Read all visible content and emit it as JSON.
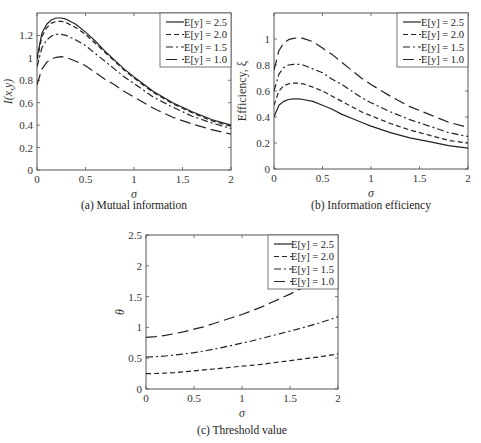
{
  "chart_data": [
    {
      "id": "a",
      "type": "line",
      "caption": "(a) Mutual information",
      "xlabel": "σ",
      "ylabel": "I(x,y)",
      "xlim": [
        0,
        2
      ],
      "ylim": [
        0,
        1.4
      ],
      "xticks": [
        "0",
        "0.5",
        "1",
        "1.5",
        "2"
      ],
      "yticks": [
        "0",
        "0.2",
        "0.4",
        "0.6",
        "0.8",
        "1",
        "1.2"
      ],
      "ytick_values": [
        0,
        0.2,
        0.4,
        0.6,
        0.8,
        1.0,
        1.2
      ],
      "xtick_values": [
        0,
        0.5,
        1,
        1.5,
        2
      ],
      "grid": false,
      "legend": "top-right",
      "x": [
        0,
        0.05,
        0.1,
        0.15,
        0.2,
        0.25,
        0.3,
        0.4,
        0.5,
        0.6,
        0.7,
        0.8,
        0.9,
        1.0,
        1.2,
        1.4,
        1.6,
        1.8,
        2.0
      ],
      "series": [
        {
          "name": "E[y] = 2.5",
          "style": "solid",
          "values": [
            1.0,
            1.22,
            1.3,
            1.34,
            1.355,
            1.355,
            1.345,
            1.3,
            1.23,
            1.15,
            1.06,
            0.98,
            0.9,
            0.83,
            0.7,
            0.6,
            0.52,
            0.45,
            0.4
          ]
        },
        {
          "name": "E[y] = 2.0",
          "style": "dashed",
          "values": [
            0.98,
            1.19,
            1.27,
            1.31,
            1.325,
            1.325,
            1.315,
            1.27,
            1.21,
            1.13,
            1.05,
            0.97,
            0.89,
            0.82,
            0.69,
            0.59,
            0.51,
            0.44,
            0.39
          ]
        },
        {
          "name": "E[y] = 1.5",
          "style": "dashdot",
          "values": [
            0.92,
            1.09,
            1.16,
            1.195,
            1.21,
            1.21,
            1.2,
            1.16,
            1.11,
            1.04,
            0.97,
            0.9,
            0.83,
            0.77,
            0.65,
            0.56,
            0.48,
            0.42,
            0.37
          ]
        },
        {
          "name": "E[y] = 1.0",
          "style": "longdash",
          "values": [
            0.76,
            0.9,
            0.96,
            0.99,
            1.005,
            1.01,
            1.005,
            0.97,
            0.93,
            0.87,
            0.81,
            0.76,
            0.7,
            0.65,
            0.55,
            0.47,
            0.41,
            0.36,
            0.32
          ]
        }
      ]
    },
    {
      "id": "b",
      "type": "line",
      "caption": "(b) Information efficiency",
      "xlabel": "σ",
      "ylabel": "Efficiency, ξ",
      "xlim": [
        0,
        2
      ],
      "ylim": [
        0,
        1.2
      ],
      "xticks": [
        "0",
        "0.5",
        "1",
        "1.5",
        "2"
      ],
      "yticks": [
        "0",
        "0.2",
        "0.4",
        "0.6",
        "0.8",
        "1"
      ],
      "ytick_values": [
        0,
        0.2,
        0.4,
        0.6,
        0.8,
        1.0
      ],
      "xtick_values": [
        0,
        0.5,
        1,
        1.5,
        2
      ],
      "grid": false,
      "legend": "top-right",
      "x": [
        0,
        0.05,
        0.1,
        0.15,
        0.2,
        0.25,
        0.3,
        0.4,
        0.5,
        0.6,
        0.7,
        0.8,
        0.9,
        1.0,
        1.2,
        1.4,
        1.6,
        1.8,
        2.0
      ],
      "series": [
        {
          "name": "E[y] = 2.5",
          "style": "solid",
          "values": [
            0.4,
            0.49,
            0.52,
            0.535,
            0.54,
            0.54,
            0.535,
            0.52,
            0.49,
            0.46,
            0.42,
            0.39,
            0.36,
            0.33,
            0.28,
            0.24,
            0.21,
            0.18,
            0.16
          ]
        },
        {
          "name": "E[y] = 2.0",
          "style": "dashed",
          "values": [
            0.49,
            0.6,
            0.64,
            0.655,
            0.66,
            0.66,
            0.655,
            0.63,
            0.6,
            0.56,
            0.52,
            0.48,
            0.44,
            0.41,
            0.35,
            0.3,
            0.26,
            0.22,
            0.2
          ]
        },
        {
          "name": "E[y] = 1.5",
          "style": "dashdot",
          "values": [
            0.6,
            0.73,
            0.78,
            0.8,
            0.805,
            0.805,
            0.8,
            0.77,
            0.74,
            0.69,
            0.65,
            0.6,
            0.55,
            0.51,
            0.44,
            0.38,
            0.33,
            0.28,
            0.25
          ]
        },
        {
          "name": "E[y] = 1.0",
          "style": "longdash",
          "values": [
            0.76,
            0.91,
            0.97,
            0.995,
            1.005,
            1.01,
            1.005,
            0.98,
            0.93,
            0.88,
            0.82,
            0.76,
            0.7,
            0.65,
            0.56,
            0.48,
            0.42,
            0.36,
            0.32
          ]
        }
      ]
    },
    {
      "id": "c",
      "type": "line",
      "caption": "(c) Threshold value",
      "xlabel": "σ",
      "ylabel": "θ",
      "xlim": [
        0,
        2
      ],
      "ylim": [
        0,
        2.5
      ],
      "xticks": [
        "0",
        "0.5",
        "1",
        "1.5",
        "2"
      ],
      "yticks": [
        "0",
        "0.5",
        "1",
        "1.5",
        "2",
        "2.5"
      ],
      "ytick_values": [
        0,
        0.5,
        1,
        1.5,
        2,
        2.5
      ],
      "xtick_values": [
        0,
        0.5,
        1,
        1.5,
        2
      ],
      "grid": false,
      "legend": "top-right",
      "x": [
        0,
        0.1,
        0.2,
        0.3,
        0.4,
        0.5,
        0.6,
        0.7,
        0.8,
        0.9,
        1.0,
        1.1,
        1.2,
        1.3,
        1.4,
        1.5,
        1.6,
        1.7,
        1.8,
        1.9,
        2.0
      ],
      "series": [
        {
          "name": "E[y] = 2.5",
          "style": "solid",
          "values": []
        },
        {
          "name": "E[y] = 2.0",
          "style": "dashed",
          "values": [
            0.25,
            0.252,
            0.258,
            0.267,
            0.28,
            0.295,
            0.31,
            0.325,
            0.34,
            0.355,
            0.37,
            0.385,
            0.4,
            0.42,
            0.44,
            0.46,
            0.48,
            0.5,
            0.52,
            0.545,
            0.57
          ]
        },
        {
          "name": "E[y] = 1.5",
          "style": "dashdot",
          "values": [
            0.52,
            0.525,
            0.535,
            0.55,
            0.57,
            0.59,
            0.615,
            0.645,
            0.675,
            0.71,
            0.745,
            0.78,
            0.82,
            0.86,
            0.9,
            0.94,
            0.98,
            1.025,
            1.07,
            1.12,
            1.17
          ]
        },
        {
          "name": "E[y] = 1.0",
          "style": "longdash",
          "values": [
            0.84,
            0.85,
            0.87,
            0.9,
            0.93,
            0.97,
            1.01,
            1.06,
            1.11,
            1.16,
            1.21,
            1.27,
            1.33,
            1.4,
            1.47,
            1.54,
            1.62,
            1.7,
            null,
            null,
            null
          ]
        }
      ]
    }
  ]
}
